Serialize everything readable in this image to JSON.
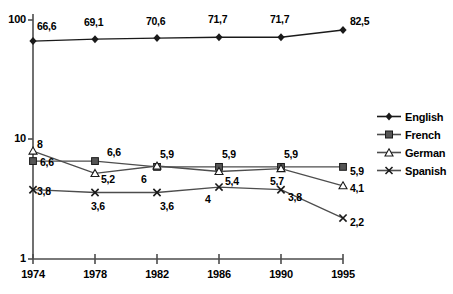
{
  "chart_data": {
    "type": "line",
    "title": "",
    "subtitle": "",
    "xlabel": "",
    "ylabel": "",
    "x": [
      1974,
      1978,
      1982,
      1986,
      1990,
      1995
    ],
    "categories": [
      "1974",
      "1978",
      "1982",
      "1986",
      "1990",
      "1995"
    ],
    "yscale": "log",
    "ylim": [
      1,
      100
    ],
    "y_ticks": [
      "1",
      "10",
      "100"
    ],
    "y_tick_values": [
      1,
      10,
      100
    ],
    "grid": false,
    "legend_position": "right",
    "series": [
      {
        "name": "English",
        "marker": "filled-diamond",
        "color": "#1a1a1a",
        "values": [
          66.6,
          69.1,
          70.6,
          71.7,
          71.7,
          82.5
        ],
        "labels": [
          "66,6",
          "69,1",
          "70,6",
          "71,7",
          "71,7",
          "82,5"
        ]
      },
      {
        "name": "French",
        "marker": "filled-square",
        "color": "#4d4d4d",
        "values": [
          6.6,
          6.6,
          5.9,
          5.9,
          5.9,
          5.9
        ],
        "labels": [
          "6,6",
          "6,6",
          "5,9",
          "5,9",
          "5,9",
          "5,9"
        ]
      },
      {
        "name": "German",
        "marker": "open-triangle",
        "color": "#4d4d4d",
        "values": [
          8,
          5.2,
          6,
          5.4,
          5.7,
          4.1
        ],
        "labels": [
          "8",
          "5,2",
          "6",
          "5,4",
          "5,7",
          "4,1"
        ]
      },
      {
        "name": "Spanish",
        "marker": "cross-x",
        "color": "#4d4d4d",
        "values": [
          3.8,
          3.6,
          3.6,
          4,
          3.8,
          2.2
        ],
        "labels": [
          "3,8",
          "3,6",
          "3,6",
          "4",
          "3,8",
          "2,2"
        ]
      }
    ]
  },
  "legend": {
    "items": [
      {
        "label": "English"
      },
      {
        "label": "French"
      },
      {
        "label": "German"
      },
      {
        "label": "Spanish"
      }
    ]
  },
  "axes": {
    "y_labels": [
      "100",
      "10",
      "1"
    ],
    "x_labels": [
      "1974",
      "1978",
      "1982",
      "1986",
      "1990",
      "1995"
    ]
  },
  "value_labels": {
    "english": [
      "66,6",
      "69,1",
      "70,6",
      "71,7",
      "71,7",
      "82,5"
    ],
    "french": [
      "6,6",
      "6,6",
      "5,9",
      "5,9",
      "5,9",
      "5,9"
    ],
    "german": [
      "8",
      "5,2",
      "6",
      "5,4",
      "5,7",
      "4,1"
    ],
    "spanish": [
      "3,8",
      "3,6",
      "3,6",
      "4",
      "3,8",
      "2,2"
    ]
  },
  "colors": {
    "line": "#4d4d4d",
    "axis": "#4d4d4d",
    "text": "#000000",
    "background": "#ffffff"
  }
}
